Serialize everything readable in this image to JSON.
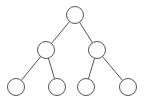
{
  "diagram": {
    "type": "binary-tree",
    "stroke_color": "#555555",
    "fill_color": "#ffffff",
    "node_radius": 8.5,
    "nodes": [
      {
        "id": "root",
        "x": 75,
        "y": 15
      },
      {
        "id": "l",
        "x": 46,
        "y": 50
      },
      {
        "id": "r",
        "x": 97,
        "y": 50
      },
      {
        "id": "ll",
        "x": 16,
        "y": 87
      },
      {
        "id": "lr",
        "x": 57,
        "y": 87
      },
      {
        "id": "rl",
        "x": 86,
        "y": 87
      },
      {
        "id": "rr",
        "x": 128,
        "y": 87
      }
    ],
    "edges": [
      [
        "root",
        "l"
      ],
      [
        "root",
        "r"
      ],
      [
        "l",
        "ll"
      ],
      [
        "l",
        "lr"
      ],
      [
        "r",
        "rl"
      ],
      [
        "r",
        "rr"
      ]
    ]
  }
}
